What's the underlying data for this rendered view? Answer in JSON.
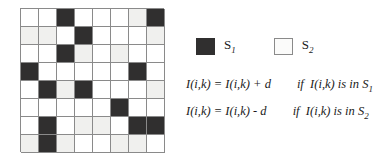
{
  "figure": {
    "type": "checkerboard-mask-grid",
    "rows": 8,
    "cols": 8,
    "colors": {
      "s1_dark": "#302f2f",
      "s2_white": "#ffffff",
      "s2_gray": "#f0f0ee",
      "grid_line": "#8a8a8a"
    },
    "legend_key": {
      "s1": "dark",
      "s2": "light"
    },
    "cells": [
      [
        "s2",
        "s2",
        "s1",
        "s2",
        "s2",
        "s2",
        "s2g",
        "s1"
      ],
      [
        "s2g",
        "s2g",
        "s2",
        "s1",
        "s2",
        "s2",
        "s2",
        "s2g"
      ],
      [
        "s2",
        "s2",
        "s1",
        "s2g",
        "s2",
        "s2g",
        "s2",
        "s2"
      ],
      [
        "s1",
        "s2",
        "s2",
        "s2",
        "s2",
        "s2",
        "s1",
        "s2"
      ],
      [
        "s2",
        "s1",
        "s2g",
        "s1",
        "s2",
        "s2",
        "s2",
        "s2g"
      ],
      [
        "s2",
        "s2",
        "s2",
        "s2",
        "s2",
        "s1",
        "s2",
        "s2"
      ],
      [
        "s2",
        "s1",
        "s2",
        "s2g",
        "s2g",
        "s2",
        "s1",
        "s1"
      ],
      [
        "s2g",
        "s1",
        "s2g",
        "s2",
        "s2",
        "s2g",
        "s2g",
        "s2"
      ]
    ]
  },
  "legend": {
    "items": [
      {
        "swatch": "dark",
        "label": "S",
        "subscript": "1"
      },
      {
        "swatch": "light",
        "label": "S",
        "subscript": "2"
      }
    ]
  },
  "equations": [
    {
      "expression": "I(i,k) = I(i,k) + d",
      "condition_prefix": "if",
      "condition_body": "I(i,k) is in S",
      "condition_subscript": "1"
    },
    {
      "expression": "I(i,k) = I(i,k) - d",
      "condition_prefix": "if",
      "condition_body": "I(i,k) is in S",
      "condition_subscript": "2"
    }
  ]
}
